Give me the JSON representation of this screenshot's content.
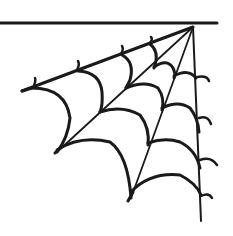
{
  "illustration": {
    "subject": "corner spider web",
    "style": "black line-art clip art",
    "colors": {
      "ink": "#1a1a1a",
      "background": "#ffffff"
    }
  }
}
